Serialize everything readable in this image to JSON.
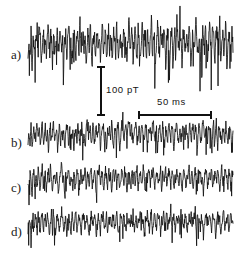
{
  "figure": {
    "type": "multi-trace-timeseries",
    "background_color": "#ffffff",
    "trace_color": "#111111",
    "width": 244,
    "height": 259
  },
  "labels": {
    "trace_a": "a)",
    "trace_b": "b)",
    "trace_c": "c)",
    "trace_d": "d)"
  },
  "scalebars": {
    "vertical": {
      "label": "100 pT",
      "x": 101,
      "y_top": 67,
      "y_bottom": 115,
      "cap_half_width": 4
    },
    "horizontal": {
      "label": "50 ms",
      "y": 115,
      "x_left": 139,
      "x_right": 211,
      "cap_half_height": 4
    }
  },
  "chart_data": {
    "type": "line",
    "title": "",
    "xlabel": "",
    "ylabel": "",
    "grid": false,
    "legend": "none",
    "x_scale_label": "50 ms",
    "y_scale_label": "100 pT",
    "x_range_px": [
      28,
      233
    ],
    "series": [
      {
        "name": "a)",
        "baseline_y": 48,
        "amplitude": 30,
        "noise_scale": 1.0,
        "seed": 17,
        "values": [
          -2,
          4,
          -9,
          14,
          -18,
          6,
          2,
          -6,
          20,
          9,
          -4,
          26,
          12,
          -10,
          5,
          18,
          -3,
          11,
          -14,
          8,
          24,
          -7,
          3,
          16,
          -20,
          10,
          1,
          -5,
          22,
          13,
          -12,
          7,
          19,
          -2,
          9,
          -16,
          4,
          15,
          -8,
          6,
          28,
          -4,
          12,
          -18,
          5,
          21,
          2,
          -9,
          17,
          8,
          -6,
          25,
          -11,
          3,
          14,
          -2,
          10,
          -20,
          7,
          18,
          -5,
          23,
          1,
          -13,
          9,
          16,
          -7,
          4,
          20,
          -3,
          12,
          -17,
          6,
          26,
          -1,
          8,
          15,
          -10,
          5,
          22,
          -6,
          11,
          3,
          -15,
          19,
          7,
          -4,
          24,
          2,
          -12,
          10,
          17,
          -8,
          5,
          21,
          -2,
          13,
          -19,
          9,
          27,
          -5,
          6,
          16,
          -11,
          4,
          23,
          1,
          -7,
          18,
          10,
          -14,
          8,
          25,
          -3,
          12,
          6,
          -16,
          20,
          2,
          -9,
          15,
          29,
          -6,
          7,
          11,
          -18,
          5,
          22,
          3,
          -10,
          17,
          9,
          -4,
          19,
          13,
          -15,
          6,
          24,
          1,
          -8,
          12,
          20,
          -13,
          4,
          16,
          -5,
          26,
          10,
          -2,
          18,
          7,
          -17,
          11,
          21,
          -6,
          3,
          14,
          -9,
          23,
          5,
          -12,
          8,
          19,
          -4,
          15,
          27,
          -7,
          2,
          10,
          -20,
          6,
          17,
          12,
          -3,
          22,
          9,
          -11,
          5,
          25,
          1,
          -6,
          13,
          18,
          -16,
          4,
          20,
          8,
          -2,
          30,
          -9,
          7,
          14,
          -5,
          11,
          23,
          -18,
          3,
          16,
          6,
          -10,
          19,
          2
        ]
      },
      {
        "name": "b)",
        "baseline_y": 137,
        "amplitude": 17,
        "noise_scale": 0.62,
        "seed": 43,
        "values": [
          -3,
          6,
          -8,
          11,
          -5,
          2,
          9,
          -12,
          4,
          14,
          -2,
          7,
          -10,
          3,
          13,
          -6,
          1,
          10,
          -4,
          8,
          -14,
          5,
          12,
          -3,
          6,
          16,
          -7,
          2,
          9,
          -11,
          4,
          13,
          -5,
          7,
          -2,
          10,
          -13,
          3,
          11,
          6,
          -9,
          15,
          -4,
          1,
          8,
          -12,
          5,
          10,
          -3,
          14,
          2,
          -7,
          9,
          12,
          -6,
          4,
          -11,
          7,
          13,
          -2,
          6,
          10,
          -5,
          3,
          16,
          -8,
          1,
          11,
          -4,
          8,
          14,
          -10,
          2,
          7,
          12,
          -6,
          5,
          -13,
          9,
          3,
          11,
          -4,
          15,
          1,
          -9,
          6,
          10,
          -3,
          13,
          7,
          -12,
          2,
          8,
          14,
          -5,
          4,
          11,
          -7,
          9,
          16,
          -2,
          6,
          12,
          -10,
          3,
          8,
          15,
          -4,
          1,
          11,
          -8,
          5,
          13,
          2,
          -6,
          9,
          14,
          -11,
          4,
          7,
          12,
          -3,
          10,
          17,
          -5,
          2,
          8,
          -13,
          6,
          11,
          3,
          -7,
          14,
          1,
          -9,
          10,
          5,
          -4,
          12,
          8,
          -2,
          15,
          6,
          -11,
          3,
          9,
          13,
          -6,
          1,
          10,
          -8,
          4,
          12,
          7,
          -3,
          16,
          2,
          -10,
          8,
          11,
          -5,
          6,
          14,
          -2,
          9,
          4,
          -12,
          7,
          13,
          1,
          -6,
          10,
          15,
          -4,
          3,
          8,
          -9,
          11,
          5,
          12,
          -7,
          2,
          16,
          -3,
          9,
          6,
          -11,
          13,
          4,
          1,
          -8,
          10,
          7,
          -5,
          14,
          2,
          -10,
          6,
          12,
          3,
          -4,
          9
        ]
      },
      {
        "name": "c)",
        "baseline_y": 182,
        "amplitude": 16,
        "noise_scale": 0.58,
        "seed": 71,
        "values": [
          2,
          -7,
          9,
          4,
          -11,
          6,
          13,
          -3,
          8,
          -5,
          12,
          1,
          -9,
          7,
          15,
          -4,
          3,
          10,
          -8,
          5,
          11,
          -2,
          14,
          6,
          -10,
          4,
          9,
          -6,
          12,
          2,
          -13,
          8,
          5,
          16,
          -3,
          7,
          -11,
          10,
          1,
          6,
          13,
          -5,
          9,
          3,
          -8,
          12,
          4,
          -2,
          15,
          7,
          -10,
          6,
          11,
          -4,
          8,
          2,
          14,
          -7,
          5,
          10,
          -3,
          9,
          13,
          -6,
          1,
          11,
          4,
          -12,
          8,
          6,
          15,
          -2,
          7,
          10,
          -9,
          3,
          12,
          5,
          -5,
          14,
          1,
          8,
          -11,
          6,
          10,
          2,
          16,
          -4,
          9,
          7,
          -8,
          3,
          13,
          5,
          -2,
          11,
          6,
          -10,
          8,
          12,
          4,
          -6,
          15,
          1,
          9,
          -3,
          7,
          13,
          -9,
          5,
          10,
          2,
          -4,
          14,
          6,
          -11,
          8,
          3,
          12,
          7,
          -5,
          10,
          1,
          16,
          -7,
          4,
          9,
          11,
          -2,
          6,
          13,
          -10,
          8,
          5,
          3,
          15,
          -6,
          2,
          11,
          7,
          -4,
          9,
          12,
          -8,
          6,
          1,
          14,
          4,
          -3,
          10,
          8,
          -11,
          5,
          13,
          2,
          -7,
          9,
          6,
          15,
          -4,
          3,
          11,
          -9,
          7,
          12,
          1,
          -5,
          10,
          8,
          14,
          -2,
          6,
          -10,
          4,
          13,
          9,
          -6,
          3,
          11,
          5,
          16,
          -8,
          2,
          7,
          10,
          -3,
          12,
          6,
          -9,
          4,
          14,
          1,
          -7,
          11,
          8,
          5,
          -4,
          13,
          3,
          -10,
          9,
          6
        ]
      },
      {
        "name": "d)",
        "baseline_y": 226,
        "amplitude": 15,
        "noise_scale": 0.55,
        "seed": 97,
        "values": [
          -4,
          8,
          3,
          -10,
          6,
          12,
          -2,
          9,
          5,
          -7,
          14,
          1,
          -9,
          7,
          11,
          -5,
          4,
          10,
          -3,
          13,
          6,
          -8,
          2,
          15,
          -6,
          9,
          4,
          -11,
          7,
          12,
          1,
          -4,
          10,
          6,
          14,
          -7,
          3,
          8,
          -10,
          5,
          11,
          2,
          -6,
          13,
          7,
          -3,
          9,
          16,
          -8,
          4,
          10,
          6,
          -12,
          2,
          8,
          11,
          -5,
          7,
          13,
          1,
          -9,
          6,
          12,
          4,
          -3,
          10,
          8,
          -11,
          5,
          14,
          2,
          -7,
          9,
          6,
          11,
          -4,
          3,
          15,
          -10,
          7,
          5,
          12,
          -2,
          8,
          10,
          -6,
          4,
          13,
          1,
          -9,
          7,
          11,
          6,
          -3,
          14,
          2,
          -8,
          10,
          5,
          12,
          -5,
          9,
          3,
          16,
          -7,
          6,
          11,
          -10,
          4,
          8,
          13,
          -2,
          7,
          5,
          -11,
          10,
          3,
          12,
          6,
          -4,
          9,
          14,
          -8,
          2,
          11,
          7,
          -5,
          13,
          4,
          10,
          -9,
          6,
          3,
          15,
          -2,
          8,
          12,
          -7,
          5,
          9,
          11,
          -3,
          6,
          14,
          -10,
          4,
          8,
          2,
          13,
          -6,
          7,
          10,
          5,
          -4,
          12,
          9,
          -8,
          3,
          11,
          6,
          15,
          -5,
          2,
          10,
          7,
          -9,
          13,
          4,
          6,
          -3,
          11,
          8,
          -12,
          5,
          9,
          14,
          -2,
          7,
          10,
          3,
          -6,
          12,
          8,
          5,
          -10,
          4,
          13,
          6,
          9,
          -7,
          2,
          11,
          15,
          -4,
          8,
          3,
          10,
          -9,
          6,
          12,
          5,
          7
        ]
      }
    ]
  }
}
